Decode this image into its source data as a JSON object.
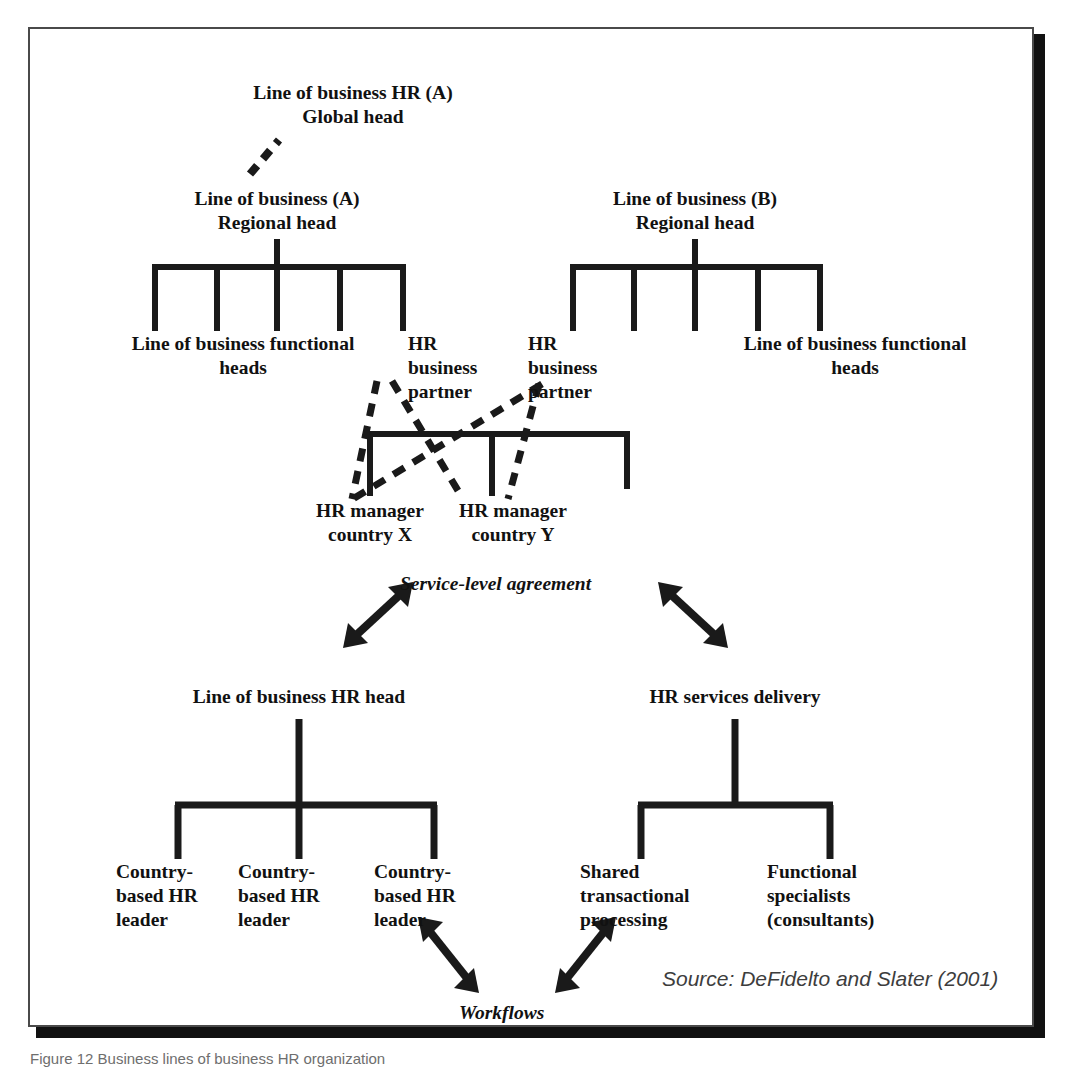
{
  "figure": {
    "top_caption_clipped": "",
    "bottom_caption_clipped": "Figure 12 Business lines of business HR organization",
    "source_note": "Source: DeFidelto and Slater (2001)",
    "colors": {
      "line": "#1a1a1a",
      "frame_border": "#4a4a4a",
      "shadow": "#111111",
      "text": "#111111",
      "source_text": "#3d3d3d",
      "background": "#ffffff"
    }
  },
  "nodes": {
    "global_head": "Line of business HR (A)\nGlobal head",
    "regional_head_a": "Line of business (A)\nRegional head",
    "regional_head_b": "Line of business (B)\nRegional head",
    "functional_heads_left": "Line of business functional\nheads",
    "functional_heads_right": "Line of business functional\nheads",
    "hr_business_partner_left": "HR\nbusiness\npartner",
    "hr_business_partner_right": "HR\nbusiness\npartner",
    "hr_manager_x": "HR manager\ncountry X",
    "hr_manager_y": "HR manager\ncountry Y",
    "service_level_agreement": "Service-level agreement",
    "lob_hr_head": "Line of business HR head",
    "hr_services_delivery": "HR services delivery",
    "country_hr_leader_1": "Country-\nbased HR\nleader",
    "country_hr_leader_2": "Country-\nbased HR\nleader",
    "country_hr_leader_3": "Country-\nbased HR\nleader",
    "shared_transactional_processing": "Shared\ntransactional\nprocessing",
    "functional_specialists": "Functional\nspecialists\n(consultants)",
    "workflows": "Workflows"
  },
  "diagram": {
    "type": "org-chart",
    "trees": [
      {
        "name": "line-of-business-a-tree",
        "parent": "Line of business (A) Regional head",
        "children_count": 5,
        "children": [
          "Line of business functional heads",
          "Line of business functional heads",
          "Line of business functional heads",
          "Line of business functional heads",
          "HR business partner"
        ]
      },
      {
        "name": "line-of-business-b-tree",
        "parent": "Line of business (B) Regional head",
        "children_count": 5,
        "children": [
          "HR business partner",
          "Line of business functional heads",
          "Line of business functional heads",
          "Line of business functional heads",
          "Line of business functional heads"
        ]
      },
      {
        "name": "hr-manager-tree",
        "parent": "",
        "children_count": 3,
        "children": [
          "HR manager country X",
          "HR manager country Y",
          ""
        ]
      },
      {
        "name": "lob-hr-head-tree",
        "parent": "Line of business HR head",
        "children_count": 3,
        "children": [
          "Country-based HR leader",
          "Country-based HR leader",
          "Country-based HR leader"
        ]
      },
      {
        "name": "hr-services-delivery-tree",
        "parent": "HR services delivery",
        "children_count": 2,
        "children": [
          "Shared transactional processing",
          "Functional specialists (consultants)"
        ]
      }
    ],
    "dashed_links": [
      {
        "from": "HR business partner (left)",
        "to": "HR manager country Y"
      },
      {
        "from": "HR business partner (left)",
        "to": "HR manager country X"
      },
      {
        "from": "HR business partner (right)",
        "to": "HR manager country X"
      },
      {
        "from": "HR business partner (right)",
        "to": "HR manager country Y"
      },
      {
        "from": "Line of business HR (A) Global head",
        "to": "Line of business (A) Regional head"
      }
    ],
    "double_arrows": [
      {
        "label": "Service-level agreement",
        "side": "left",
        "between": [
          "Line of business HR head",
          "Service-level agreement"
        ]
      },
      {
        "label": "Service-level agreement",
        "side": "right",
        "between": [
          "HR services delivery",
          "Service-level agreement"
        ]
      },
      {
        "label": "Workflows",
        "side": "left",
        "between": [
          "Country-based HR leader",
          "Workflows"
        ]
      },
      {
        "label": "Workflows",
        "side": "right",
        "between": [
          "Shared transactional processing",
          "Workflows"
        ]
      }
    ]
  }
}
